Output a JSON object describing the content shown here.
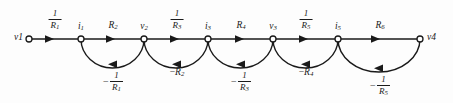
{
  "figure": {
    "name": "signal-flow-graph-ladder-network",
    "background_color": "#fdfdfd",
    "ink_color": "#1a1a1a",
    "width": 453,
    "height": 103,
    "baseline_y": 39,
    "node_radius": 3.0
  },
  "nodes": [
    {
      "id": "v1",
      "label_main": "v",
      "label_sub": "1",
      "x": 29,
      "y": 39,
      "label_position": "left"
    },
    {
      "id": "i1",
      "label_main": "i",
      "label_sub": "1",
      "x": 81,
      "y": 39,
      "label_position": "above"
    },
    {
      "id": "v2",
      "label_main": "v",
      "label_sub": "2",
      "x": 144,
      "y": 39,
      "label_position": "above"
    },
    {
      "id": "i3",
      "label_main": "i",
      "label_sub": "3",
      "x": 208,
      "y": 39,
      "label_position": "above"
    },
    {
      "id": "v3",
      "label_main": "v",
      "label_sub": "3",
      "x": 273,
      "y": 39,
      "label_position": "above"
    },
    {
      "id": "i5",
      "label_main": "i",
      "label_sub": "5",
      "x": 338,
      "y": 39,
      "label_position": "above"
    },
    {
      "id": "v4",
      "label_main": "v",
      "label_sub": "4",
      "x": 420,
      "y": 39,
      "label_position": "right"
    }
  ],
  "forward_branches": [
    {
      "id": "b1",
      "from": "v1",
      "to": "i1",
      "label_kind": "fraction",
      "numerator": "1",
      "denominator_main": "R",
      "denominator_sub": "1",
      "label_x": 55,
      "label_y": 11,
      "arrow_x": 49,
      "direction": "right"
    },
    {
      "id": "b2",
      "from": "i1",
      "to": "v2",
      "label_kind": "plain",
      "text_main": "R",
      "text_sub": "2",
      "label_x": 113,
      "label_y": 21,
      "arrow_x": 110,
      "direction": "right"
    },
    {
      "id": "b3",
      "from": "v2",
      "to": "i3",
      "label_kind": "fraction",
      "numerator": "1",
      "denominator_main": "R",
      "denominator_sub": "3",
      "label_x": 177,
      "label_y": 11,
      "arrow_x": 174,
      "direction": "right"
    },
    {
      "id": "b4",
      "from": "i3",
      "to": "v3",
      "label_kind": "plain",
      "text_main": "R",
      "text_sub": "4",
      "label_x": 241,
      "label_y": 21,
      "arrow_x": 239,
      "direction": "right"
    },
    {
      "id": "b5",
      "from": "v3",
      "to": "i5",
      "label_kind": "fraction",
      "numerator": "1",
      "denominator_main": "R",
      "denominator_sub": "5",
      "label_x": 306,
      "label_y": 11,
      "arrow_x": 303,
      "direction": "right"
    },
    {
      "id": "b6",
      "from": "i5",
      "to": "v4",
      "label_kind": "plain",
      "text_main": "R",
      "text_sub": "6",
      "label_x": 380,
      "label_y": 21,
      "arrow_x": 375,
      "direction": "right"
    }
  ],
  "feedback_arcs": [
    {
      "id": "a1",
      "from": "v2",
      "to": "i1",
      "label_kind": "signed-fraction",
      "sign": "−",
      "numerator": "1",
      "denominator_main": "R",
      "denominator_sub": "1",
      "label_x": 113,
      "label_y": 70,
      "start_x": 144,
      "end_x": 81,
      "depth": 29,
      "arrow_direction": "left"
    },
    {
      "id": "a2",
      "from": "i3",
      "to": "v2",
      "label_kind": "signed-plain",
      "sign": "−",
      "text_main": "R",
      "text_sub": "2",
      "label_x": 177,
      "label_y": 66,
      "start_x": 208,
      "end_x": 144,
      "depth": 29,
      "arrow_direction": "left"
    },
    {
      "id": "a3",
      "from": "v3",
      "to": "i3",
      "label_kind": "signed-fraction",
      "sign": "−",
      "numerator": "1",
      "denominator_main": "R",
      "denominator_sub": "3",
      "label_x": 241,
      "label_y": 70,
      "start_x": 273,
      "end_x": 208,
      "depth": 29,
      "arrow_direction": "left"
    },
    {
      "id": "a4",
      "from": "i5",
      "to": "v3",
      "label_kind": "signed-plain",
      "sign": "−",
      "text_main": "R",
      "text_sub": "4",
      "label_x": 306,
      "label_y": 66,
      "start_x": 338,
      "end_x": 273,
      "depth": 29,
      "arrow_direction": "left"
    },
    {
      "id": "a5",
      "from": "v4",
      "to": "i5",
      "label_kind": "signed-fraction",
      "sign": "−",
      "numerator": "1",
      "denominator_main": "R",
      "denominator_sub": "5",
      "label_x": 380,
      "label_y": 70,
      "start_x": 420,
      "end_x": 338,
      "depth": 33,
      "arrow_direction": "left"
    }
  ],
  "labels": {
    "node_v1": "v",
    "node_v1_sub": "1",
    "node_i1": "i",
    "node_i1_sub": "1",
    "node_v2": "v",
    "node_v2_sub": "2",
    "node_i3": "i",
    "node_i3_sub": "3",
    "node_v3": "v",
    "node_v3_sub": "3",
    "node_i5": "i",
    "node_i5_sub": "5",
    "node_v4": "v",
    "node_v4_sub": "4",
    "branch_b1_num": "1",
    "branch_b1_den": "R",
    "branch_b1_den_sub": "1",
    "branch_b2": "R",
    "branch_b2_sub": "2",
    "branch_b3_num": "1",
    "branch_b3_den": "R",
    "branch_b3_den_sub": "3",
    "branch_b4": "R",
    "branch_b4_sub": "4",
    "branch_b5_num": "1",
    "branch_b5_den": "R",
    "branch_b5_den_sub": "5",
    "branch_b6": "R",
    "branch_b6_sub": "6",
    "arc_a1_sign": "−",
    "arc_a1_num": "1",
    "arc_a1_den": "R",
    "arc_a1_den_sub": "1",
    "arc_a2_sign": "−",
    "arc_a2": "R",
    "arc_a2_sub": "2",
    "arc_a3_sign": "−",
    "arc_a3_num": "1",
    "arc_a3_den": "R",
    "arc_a3_den_sub": "3",
    "arc_a4_sign": "−",
    "arc_a4": "R",
    "arc_a4_sub": "4",
    "arc_a5_sign": "−",
    "arc_a5_num": "1",
    "arc_a5_den": "R",
    "arc_a5_den_sub": "5"
  }
}
